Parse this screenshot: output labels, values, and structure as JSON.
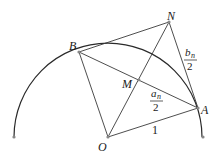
{
  "diagram": {
    "points": {
      "O": {
        "label": "O",
        "x": 108,
        "y": 137
      },
      "A": {
        "label": "A",
        "x": 198,
        "y": 108
      },
      "B": {
        "label": "B",
        "x": 79,
        "y": 52
      },
      "N": {
        "label": "N",
        "x": 169,
        "y": 22
      },
      "M": {
        "label": "M",
        "x": 139,
        "y": 80
      }
    },
    "labels": {
      "OA": "1",
      "AM_num": "a",
      "AM_sub": "n",
      "AM_den": "2",
      "AN_num": "b",
      "AN_sub": "n",
      "AN_den": "2"
    },
    "colors": {
      "line": "#3a3a3a",
      "point": "#888888"
    }
  }
}
